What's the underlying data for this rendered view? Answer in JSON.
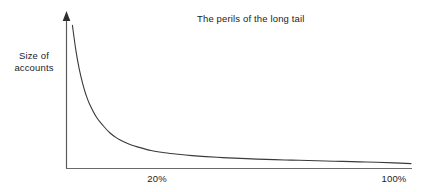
{
  "chart_data": {
    "type": "line",
    "title": "The perils of the long tail",
    "subtitle": "",
    "xlabel": "",
    "ylabel": "Size of\naccounts",
    "ylabel_lines": [
      "Size of",
      "accounts"
    ],
    "grid": false,
    "legend": null,
    "legend_position": "none",
    "xlim": [
      0,
      100
    ],
    "ylim": [
      0,
      100
    ],
    "x_tick_labels": [
      "20%",
      "100%"
    ],
    "x_tick_values": [
      20,
      100
    ],
    "y_tick_labels": [],
    "y_tick_values": [],
    "axis_arrow_y": true,
    "axis_arrow_x": false,
    "annotations": [],
    "series": [
      {
        "name": "Size of accounts",
        "color": "#3a3a3a",
        "x": [
          1,
          2,
          3,
          4,
          5,
          6,
          8,
          10,
          12,
          14,
          16,
          18,
          20,
          24,
          28,
          32,
          36,
          40,
          45,
          50,
          55,
          60,
          65,
          70,
          75,
          80,
          85,
          90,
          95,
          100
        ],
        "y": [
          97,
          80,
          67,
          57,
          49,
          43,
          34,
          28,
          23,
          19.5,
          17,
          15,
          13.5,
          11,
          9.5,
          8.4,
          7.5,
          6.8,
          6.1,
          5.6,
          5.1,
          4.7,
          4.4,
          4.1,
          3.8,
          3.5,
          3.2,
          2.9,
          2.5,
          2.0
        ]
      }
    ]
  },
  "colors": {
    "background": "#ffffff",
    "axis": "#4a4a4a",
    "curve": "#3a3a3a",
    "text": "#1c1c1c"
  },
  "labels": {
    "title": "The perils of the long tail",
    "y_axis_line1": "Size of",
    "y_axis_line2": "accounts",
    "x_tick_20": "20%",
    "x_tick_100": "100%"
  }
}
